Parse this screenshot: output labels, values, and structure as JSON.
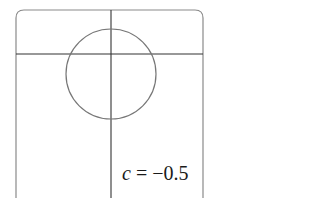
{
  "figure": {
    "label_var": "c",
    "label_rest": " = −0.5",
    "colors": {
      "frame": "#8a8a8a",
      "axes": "#333333",
      "curve": "#777777",
      "background": "#ffffff"
    },
    "frame": {
      "x": 16,
      "y": 10,
      "width": 187,
      "height": 196,
      "corner_radius": 8
    },
    "axes": {
      "vertical_x": 111,
      "horizontal_y": 54
    },
    "circle": {
      "cx": 111,
      "cy": 74,
      "r": 45
    }
  }
}
